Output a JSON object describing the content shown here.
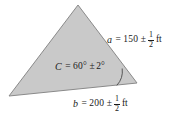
{
  "figure": {
    "name": "triangle-measurement-diagram",
    "background_color": "#ffffff",
    "shape": {
      "type": "triangle",
      "fill_color": "#c9c9c9",
      "stroke_color": "#8a8a8a",
      "vertices": {
        "apex": [
          78,
          5
        ],
        "left": [
          9,
          96
        ],
        "right": [
          137,
          83
        ]
      }
    },
    "angle_arc": {
      "at_vertex": "right",
      "stroke_color": "#4a4a4a",
      "radius": 21
    }
  },
  "labels": {
    "side_a": {
      "variable": "a",
      "equals": "=",
      "value": "150",
      "plus_minus": "±",
      "tolerance_numerator": "1",
      "tolerance_denominator": "2",
      "unit": "ft"
    },
    "angle_C": {
      "variable": "C",
      "equals": "=",
      "value": "60°",
      "plus_minus": "±",
      "tolerance": "2°"
    },
    "side_b": {
      "variable": "b",
      "equals": "=",
      "value": "200",
      "plus_minus": "±",
      "tolerance_numerator": "1",
      "tolerance_denominator": "2",
      "unit": "ft"
    }
  }
}
